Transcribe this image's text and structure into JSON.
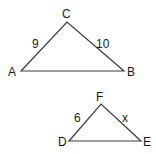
{
  "diagram": {
    "type": "similar-triangles",
    "triangles": [
      {
        "name": "ABC",
        "vertices": {
          "A": {
            "label": "A",
            "x": 21,
            "y": 71
          },
          "B": {
            "label": "B",
            "x": 124,
            "y": 71
          },
          "C": {
            "label": "C",
            "x": 67,
            "y": 22
          }
        },
        "sides": {
          "AC": {
            "label": "9"
          },
          "CB": {
            "label": "10"
          },
          "AB": {
            "label": ""
          }
        }
      },
      {
        "name": "DEF",
        "vertices": {
          "D": {
            "label": "D",
            "x": 69,
            "y": 141
          },
          "E": {
            "label": "E",
            "x": 141,
            "y": 141
          },
          "F": {
            "label": "F",
            "x": 101,
            "y": 104
          }
        },
        "sides": {
          "DF": {
            "label": "6"
          },
          "FE": {
            "label": "x"
          },
          "DE": {
            "label": ""
          }
        }
      }
    ],
    "colors": {
      "line": "#3a3a3a",
      "text": "#1a1a1a",
      "background": "#ffffff"
    }
  }
}
